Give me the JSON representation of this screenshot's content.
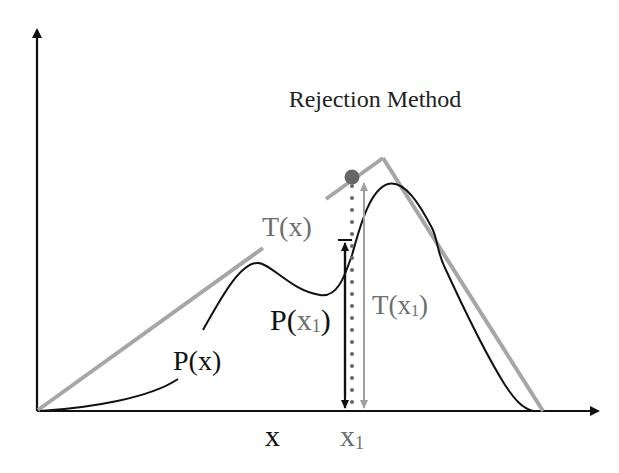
{
  "title": "Rejection Method",
  "colors": {
    "axis": "#111111",
    "pdf_curve": "#111111",
    "envelope": "#a6a6a6",
    "envelope_label": "#6e6e6e",
    "sample_point": "#666666",
    "dotted_line": "#666666",
    "arrow_p": "#111111",
    "arrow_t": "#a0a0a0"
  },
  "labels": {
    "envelope": "T(x)",
    "pdf": "P(x)",
    "pdf_at_x1_prefix": "P(",
    "pdf_at_x1_var": "x",
    "pdf_at_x1_sub": "1",
    "pdf_at_x1_suffix": ")",
    "envelope_at_x1_prefix": "T(",
    "envelope_at_x1_var": "x",
    "envelope_at_x1_sub": "1",
    "envelope_at_x1_suffix": ")",
    "x_axis_var": "x",
    "x1_var": "x",
    "x1_sub": "1"
  },
  "geometry": {
    "origin": [
      37,
      411
    ],
    "x_axis_end": [
      600,
      411
    ],
    "y_axis_end": [
      37,
      28
    ],
    "envelope_peak": [
      383,
      157
    ],
    "envelope_end": [
      542,
      411
    ],
    "x1": 346,
    "sample_point": [
      352,
      177
    ]
  }
}
